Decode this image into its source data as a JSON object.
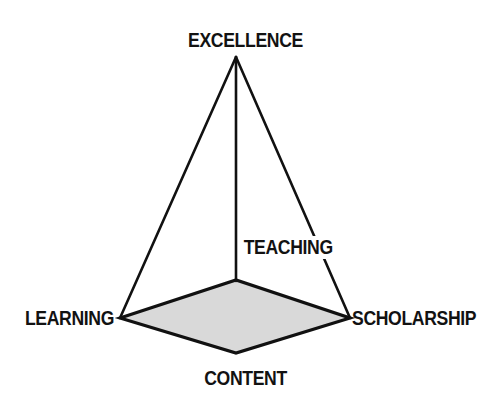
{
  "diagram": {
    "type": "pyramid-concept-diagram",
    "apex": {
      "label": "EXCELLENCE"
    },
    "base_vertices": [
      {
        "id": "learning",
        "label": "LEARNING",
        "position": "left"
      },
      {
        "id": "scholarship",
        "label": "SCHOLARSHIP",
        "position": "right"
      },
      {
        "id": "content",
        "label": "CONTENT",
        "position": "bottom-front"
      }
    ],
    "edge_labels": [
      {
        "id": "teaching",
        "label": "TEACHING"
      }
    ],
    "colors": {
      "stroke": "#111111",
      "base_fill": "#d9d9d9",
      "text": "#121212",
      "background": "#ffffff"
    },
    "geometry": {
      "apex_point": [
        236,
        57
      ],
      "base_left": [
        120,
        318
      ],
      "base_right": [
        350,
        318
      ],
      "base_back": [
        236,
        280
      ],
      "base_front": [
        236,
        353
      ]
    }
  }
}
